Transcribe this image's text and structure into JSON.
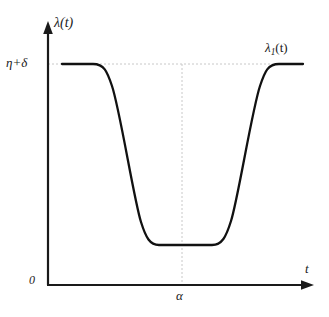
{
  "figure": {
    "name": "lambda-1-t-response-curve",
    "background_color": "#ffffff",
    "axis_color": "#1a1a1a",
    "curve_color": "#111111",
    "guide_color": "#c8c8c8"
  },
  "labels": {
    "y_axis_title": "λ(t)",
    "x_axis_title": "t",
    "y_tick": "η+δ",
    "x_tick": "α",
    "origin": "0",
    "curve_name_base": "λ",
    "curve_name_subscript": "1",
    "curve_name_arg": "(t)"
  },
  "chart_data": {
    "type": "line",
    "title": "",
    "xlabel": "t",
    "ylabel": "λ(t)",
    "series": [
      {
        "name": "λ₁(t)",
        "x": [
          0.06,
          0.12,
          0.18,
          0.22,
          0.26,
          0.3,
          0.34,
          0.38,
          0.42,
          0.46,
          0.5,
          0.54,
          0.58,
          0.62,
          0.66,
          0.7,
          0.74,
          0.78,
          0.82,
          0.86,
          0.9,
          0.96
        ],
        "y": [
          1.0,
          1.0,
          1.0,
          0.98,
          0.9,
          0.72,
          0.52,
          0.32,
          0.14,
          0.04,
          0.0,
          0.0,
          0.0,
          0.0,
          0.02,
          0.1,
          0.3,
          0.55,
          0.8,
          0.96,
          1.0,
          1.0
        ]
      }
    ],
    "xlim": [
      0,
      1
    ],
    "ylim": [
      0,
      1.08
    ],
    "grid": false,
    "legend": "none",
    "annotations": [
      {
        "name": "upper-level-guide",
        "kind": "horizontal-dashed-line",
        "value_label": "η+δ",
        "y": 1.0
      },
      {
        "name": "alpha-guide",
        "kind": "vertical-dashed-line",
        "value_label": "α",
        "x": 0.605
      },
      {
        "name": "curve-label",
        "kind": "text",
        "text": "λ₁(t)",
        "x": 0.92,
        "y": 1.06
      }
    ]
  },
  "geometry": {
    "y_axis_x": 48,
    "x_axis_y": 285,
    "y_axis_top": 22,
    "x_axis_right": 313,
    "upper_level_y": 64,
    "lower_level_y": 245,
    "alpha_x": 182,
    "curve_start_x": 62,
    "curve_end_x": 303,
    "curve_path": "M 62,64 L 93,64 C 104,64 107,71 112,86 C 120,110 134,200 141,222 C 146,238 150,245 159,245 L 212,245 C 222,245 226,237 231,221 C 238,199 252,110 260,86 C 265,71 268,64 279,64 L 303,64"
  }
}
